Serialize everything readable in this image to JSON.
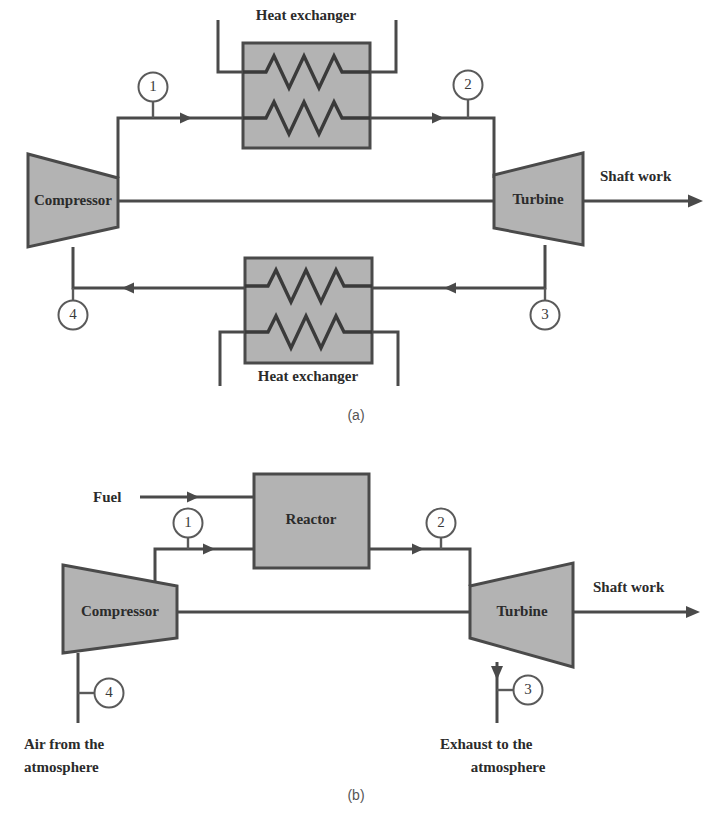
{
  "figure": {
    "panels": [
      {
        "id": "a",
        "caption": "(a)",
        "type": "closed-cycle-gas-turbine",
        "equipment": {
          "compressor": "Compressor",
          "turbine": "Turbine",
          "heat_exchanger_top": "Heat exchanger",
          "heat_exchanger_bottom": "Heat exchanger"
        },
        "flow_labels": {
          "shaft_work": "Shaft work"
        },
        "state_points": [
          "1",
          "2",
          "3",
          "4"
        ]
      },
      {
        "id": "b",
        "caption": "(b)",
        "type": "open-cycle-gas-turbine",
        "equipment": {
          "compressor": "Compressor",
          "turbine": "Turbine",
          "reactor": "Reactor"
        },
        "flow_labels": {
          "fuel": "Fuel",
          "shaft_work": "Shaft work",
          "air_inlet_line1": "Air from the",
          "air_inlet_line2": "atmosphere",
          "exhaust_line1": "Exhaust to the",
          "exhaust_line2": "atmosphere"
        },
        "state_points": [
          "1",
          "2",
          "3",
          "4"
        ]
      }
    ]
  },
  "colors": {
    "equipment_fill": "#b3b3b3",
    "line": "#4a4a4a",
    "text": "#2b2b2b",
    "background": "#ffffff"
  }
}
